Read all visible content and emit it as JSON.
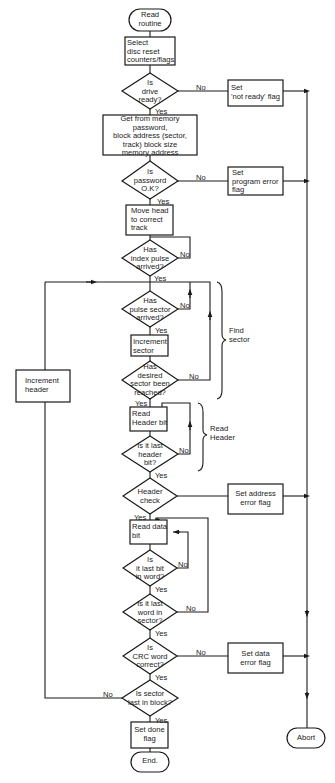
{
  "diagram": {
    "type": "flowchart",
    "nodes": {
      "start": {
        "kind": "terminator",
        "text": "Read\nroutine"
      },
      "select_disc": {
        "kind": "process",
        "text": "Select\ndisc reset\ncounters/flags"
      },
      "drive_ready": {
        "kind": "decision",
        "text": "Is\ndrive\nready?"
      },
      "set_not_ready": {
        "kind": "process",
        "text": "Set\n'not ready' flag"
      },
      "get_from_memory": {
        "kind": "process",
        "text": "Get from memory\npassword,\nblock address (sector,\ntrack) block size\nmemory address"
      },
      "password_ok": {
        "kind": "decision",
        "text": "Is\npassword\nO.K?"
      },
      "set_program_error": {
        "kind": "process",
        "text": "Set\nprogram error\nflag"
      },
      "move_head": {
        "kind": "process",
        "text": "Move head\nto correct\ntrack"
      },
      "index_pulse": {
        "kind": "decision",
        "text": "Has\nindex pulse\narrived?"
      },
      "pulse_sector": {
        "kind": "decision",
        "text": "Has\npulse sector\narrived?"
      },
      "increment_sector": {
        "kind": "process",
        "text": "Increment\nsector"
      },
      "desired_sector": {
        "kind": "decision",
        "text": "Has\ndesired\nsector been\nreached?"
      },
      "read_header_bit": {
        "kind": "process",
        "text": "Read\nHeader bit"
      },
      "last_header_bit": {
        "kind": "decision",
        "text": "Is it last\nheader\nbit?"
      },
      "header_check": {
        "kind": "decision",
        "text": "Header\ncheck"
      },
      "set_address_error": {
        "kind": "process",
        "text": "Set address\nerror flag"
      },
      "read_data_bit": {
        "kind": "process",
        "text": "Read data\nbit"
      },
      "last_bit_in_word": {
        "kind": "decision",
        "text": "Is\nit last bit\nin word?"
      },
      "last_word_in_sector": {
        "kind": "decision",
        "text": "Is it last\nword in\nsector?"
      },
      "crc_correct": {
        "kind": "decision",
        "text": "Is\nCRC word\ncorrect?"
      },
      "set_data_error": {
        "kind": "process",
        "text": "Set data\nerror flag"
      },
      "sector_last_in_block": {
        "kind": "decision",
        "text": "Is sector\nlast in block?"
      },
      "set_done": {
        "kind": "process",
        "text": "Set done\nflag"
      },
      "end": {
        "kind": "terminator",
        "text": "End."
      },
      "increment_header": {
        "kind": "process",
        "text": "Increment\nheader"
      },
      "abort": {
        "kind": "terminator",
        "text": "Abort"
      }
    },
    "edge_labels": {
      "yes": "Yes",
      "no": "No"
    },
    "groups": {
      "find_sector": "Find\nsector",
      "read_header": "Read\nHeader"
    },
    "edges": [
      {
        "from": "start",
        "to": "select_disc"
      },
      {
        "from": "select_disc",
        "to": "drive_ready"
      },
      {
        "from": "drive_ready",
        "to": "get_from_memory",
        "label": "Yes"
      },
      {
        "from": "drive_ready",
        "to": "set_not_ready",
        "label": "No"
      },
      {
        "from": "get_from_memory",
        "to": "password_ok"
      },
      {
        "from": "password_ok",
        "to": "move_head",
        "label": "Yes"
      },
      {
        "from": "password_ok",
        "to": "set_program_error",
        "label": "No"
      },
      {
        "from": "move_head",
        "to": "index_pulse"
      },
      {
        "from": "index_pulse",
        "to": "index_pulse",
        "label": "No"
      },
      {
        "from": "index_pulse",
        "to": "pulse_sector",
        "label": "Yes"
      },
      {
        "from": "pulse_sector",
        "to": "pulse_sector",
        "label": "No"
      },
      {
        "from": "pulse_sector",
        "to": "increment_sector",
        "label": "Yes"
      },
      {
        "from": "increment_sector",
        "to": "desired_sector"
      },
      {
        "from": "desired_sector",
        "to": "pulse_sector",
        "label": "No"
      },
      {
        "from": "desired_sector",
        "to": "read_header_bit",
        "label": "Yes"
      },
      {
        "from": "read_header_bit",
        "to": "last_header_bit"
      },
      {
        "from": "last_header_bit",
        "to": "read_header_bit",
        "label": "No"
      },
      {
        "from": "last_header_bit",
        "to": "header_check",
        "label": "Yes"
      },
      {
        "from": "header_check",
        "to": "set_address_error"
      },
      {
        "from": "header_check",
        "to": "read_data_bit",
        "label": "Yes"
      },
      {
        "from": "read_data_bit",
        "to": "last_bit_in_word"
      },
      {
        "from": "last_bit_in_word",
        "to": "read_data_bit",
        "label": "No"
      },
      {
        "from": "last_bit_in_word",
        "to": "last_word_in_sector",
        "label": "Yes"
      },
      {
        "from": "last_word_in_sector",
        "to": "read_data_bit",
        "label": "No"
      },
      {
        "from": "last_word_in_sector",
        "to": "crc_correct",
        "label": "Yes"
      },
      {
        "from": "crc_correct",
        "to": "set_data_error",
        "label": "No"
      },
      {
        "from": "crc_correct",
        "to": "sector_last_in_block",
        "label": "Yes"
      },
      {
        "from": "sector_last_in_block",
        "to": "increment_header",
        "label": "No"
      },
      {
        "from": "sector_last_in_block",
        "to": "set_done",
        "label": "Yes"
      },
      {
        "from": "set_done",
        "to": "end"
      },
      {
        "from": "increment_header",
        "to": "pulse_sector"
      },
      {
        "from": "set_not_ready",
        "to": "abort"
      },
      {
        "from": "set_program_error",
        "to": "abort"
      },
      {
        "from": "set_address_error",
        "to": "abort"
      },
      {
        "from": "set_data_error",
        "to": "abort"
      }
    ]
  }
}
